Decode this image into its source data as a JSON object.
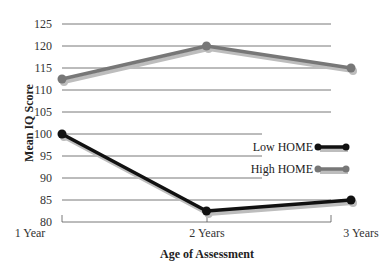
{
  "chart_data": {
    "type": "line",
    "title": "",
    "xlabel": "Age of Assessment",
    "ylabel": "Mean IQ Score",
    "categories": [
      "1 Year",
      "2 Years",
      "3 Years"
    ],
    "ylim": [
      80,
      125
    ],
    "yticks": [
      80,
      85,
      90,
      95,
      100,
      105,
      110,
      115,
      120,
      125
    ],
    "grid": true,
    "legend_position": "right-middle",
    "series": [
      {
        "name": "Low HOME",
        "color": "#111111",
        "values": [
          100,
          82.5,
          85
        ]
      },
      {
        "name": "High HOME",
        "color": "#777777",
        "values": [
          112.5,
          120,
          115
        ]
      }
    ]
  },
  "legend": {
    "items": [
      {
        "label": "Low HOME",
        "color": "#111111"
      },
      {
        "label": "High HOME",
        "color": "#777777"
      }
    ]
  }
}
